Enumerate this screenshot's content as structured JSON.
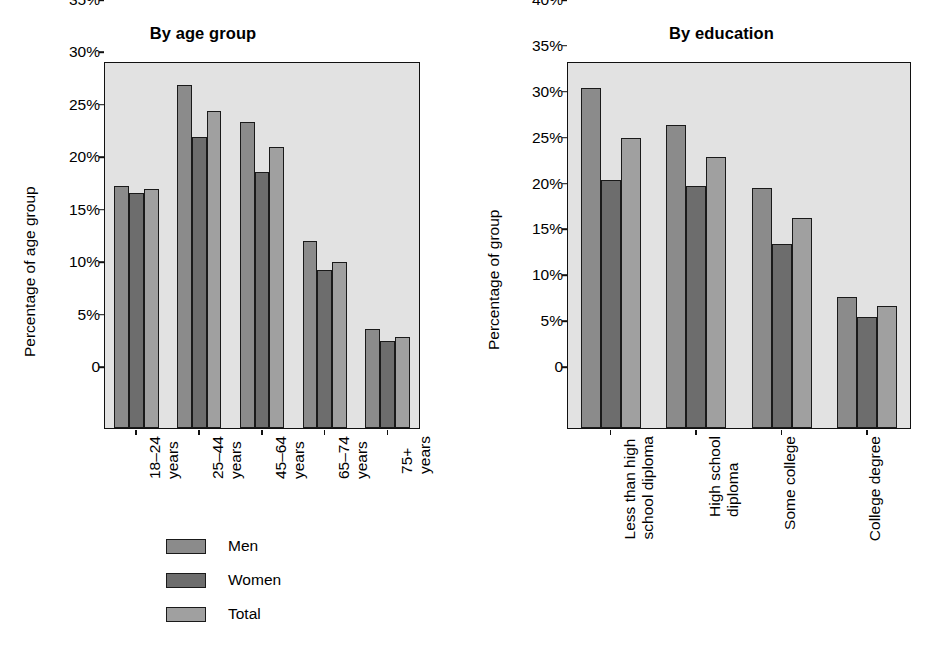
{
  "figure": {
    "background": "#ffffff",
    "plot_background": "#e2e2e2",
    "top_caption_remnant": "",
    "series_colors": {
      "men": "#8b8b8b",
      "women": "#6d6d6d",
      "total": "#a0a0a0"
    }
  },
  "legend": {
    "items": [
      {
        "label": "Men",
        "color": "#8b8b8b",
        "key": "men"
      },
      {
        "label": "Women",
        "color": "#6d6d6d",
        "key": "women"
      },
      {
        "label": "Total",
        "color": "#a0a0a0",
        "key": "total"
      }
    ]
  },
  "chart_data": [
    {
      "id": "by-age-group",
      "type": "bar",
      "title": "By age group",
      "xlabel": "",
      "ylabel": "Percentage of age group",
      "ylim": [
        0,
        35
      ],
      "ytick_values": [
        0,
        5,
        10,
        15,
        20,
        25,
        30,
        35
      ],
      "ytick_labels": [
        "0",
        "5%",
        "10%",
        "15%",
        "20%",
        "25%",
        "30%",
        "35%"
      ],
      "grid": false,
      "legend_position": "below-left",
      "categories": [
        "18–24 years",
        "25–44 years",
        "45–64 years",
        "65–74 years",
        "75+ years"
      ],
      "category_lines": [
        [
          "18–24",
          "years"
        ],
        [
          "25–44",
          "years"
        ],
        [
          "45–64",
          "years"
        ],
        [
          "65–74",
          "years"
        ],
        [
          "75+",
          "years"
        ]
      ],
      "series": [
        {
          "name": "Men",
          "key": "men",
          "values": [
            23.1,
            32.7,
            29.2,
            17.8,
            9.4
          ]
        },
        {
          "name": "Women",
          "key": "women",
          "values": [
            22.4,
            27.8,
            24.4,
            15.1,
            8.3
          ]
        },
        {
          "name": "Total",
          "key": "total",
          "values": [
            22.8,
            30.2,
            26.8,
            15.8,
            8.7
          ]
        }
      ]
    },
    {
      "id": "by-education",
      "type": "bar",
      "title": "By education",
      "xlabel": "",
      "ylabel": "Percentage of group",
      "ylim": [
        0,
        40
      ],
      "ytick_values": [
        0,
        5,
        10,
        15,
        20,
        25,
        30,
        35,
        40
      ],
      "ytick_labels": [
        "0",
        "5%",
        "10%",
        "15%",
        "20%",
        "25%",
        "30%",
        "35%",
        "40%"
      ],
      "grid": false,
      "legend_position": "shared-left-chart",
      "categories": [
        "Less than high school diploma",
        "High school diploma",
        "Some college",
        "College degree"
      ],
      "category_lines": [
        [
          "Less than high",
          "school diploma"
        ],
        [
          "High school",
          "diploma"
        ],
        [
          "Some college"
        ],
        [
          "College degree"
        ]
      ],
      "series": [
        {
          "name": "Men",
          "key": "men",
          "values": [
            37.1,
            33.0,
            26.2,
            14.3
          ]
        },
        {
          "name": "Women",
          "key": "women",
          "values": [
            27.0,
            26.4,
            20.1,
            12.1
          ]
        },
        {
          "name": "Total",
          "key": "total",
          "values": [
            31.6,
            29.5,
            22.9,
            13.3
          ]
        }
      ]
    }
  ]
}
